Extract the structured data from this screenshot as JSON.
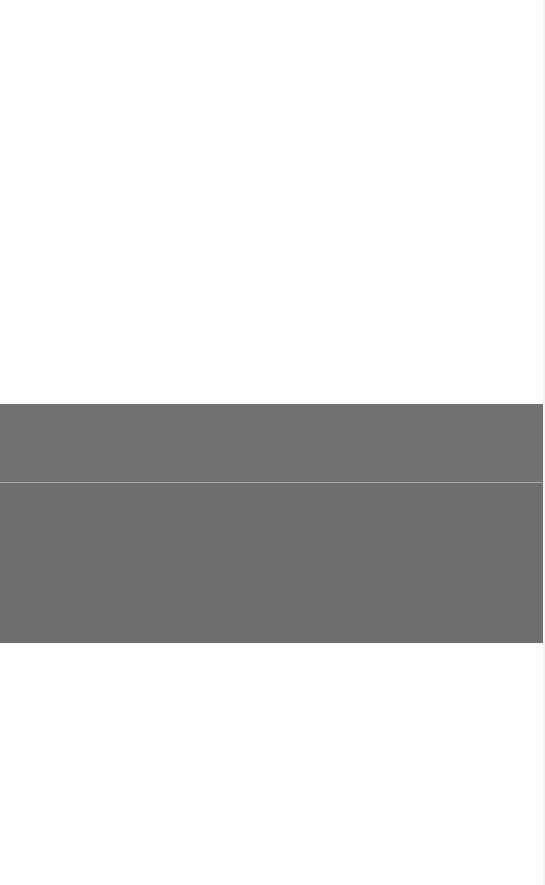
{
  "page": {
    "background_color": "#fefefe"
  },
  "band": {
    "color": "#6f6f6f",
    "divider_color": "#a9a9a9",
    "top_px": 404,
    "height_px": 239,
    "divider_offset_px": 78
  }
}
